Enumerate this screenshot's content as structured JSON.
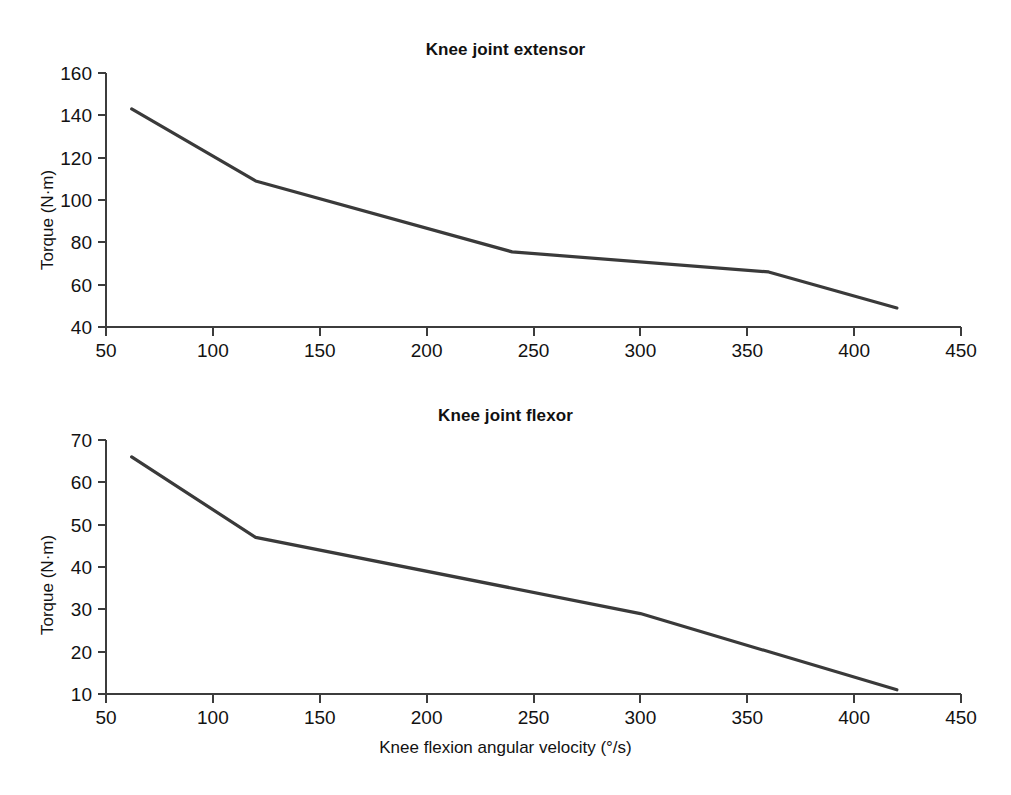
{
  "figure": {
    "background": "#ffffff",
    "line_color": "#3a3a3a",
    "axis_color": "#3c3c3c",
    "shared_xlabel": "Knee flexion angular velocity (°/s)"
  },
  "chart_data": [
    {
      "type": "line",
      "title": "Knee joint extensor",
      "xlabel": "Knee flexion angular velocity (°/s)",
      "ylabel": "Torque (N·m)",
      "xlim": [
        50,
        450
      ],
      "ylim": [
        40,
        160
      ],
      "xticks": [
        50,
        100,
        150,
        200,
        250,
        300,
        350,
        400,
        450
      ],
      "xtick_labels": [
        "50",
        "100",
        "150",
        "200",
        "250",
        "300",
        "350",
        "400",
        "450"
      ],
      "yticks": [
        40,
        60,
        80,
        100,
        120,
        140,
        160
      ],
      "ytick_labels": [
        "40",
        "60",
        "80",
        "100",
        "120",
        "140",
        "160"
      ],
      "grid": false,
      "legend": "none",
      "series": [
        {
          "name": "Knee joint extensor torque",
          "x": [
            62,
            120,
            240,
            360,
            420
          ],
          "values": [
            143,
            109,
            75.5,
            66,
            49
          ]
        }
      ]
    },
    {
      "type": "line",
      "title": "Knee joint flexor",
      "xlabel": "Knee flexion angular velocity (°/s)",
      "ylabel": "Torque (N·m)",
      "xlim": [
        50,
        450
      ],
      "ylim": [
        10,
        70
      ],
      "xticks": [
        50,
        100,
        150,
        200,
        250,
        300,
        350,
        400,
        450
      ],
      "xtick_labels": [
        "50",
        "100",
        "150",
        "200",
        "250",
        "300",
        "350",
        "400",
        "450"
      ],
      "yticks": [
        10,
        20,
        30,
        40,
        50,
        60,
        70
      ],
      "ytick_labels": [
        "10",
        "20",
        "30",
        "40",
        "50",
        "60",
        "70"
      ],
      "grid": false,
      "legend": "none",
      "series": [
        {
          "name": "Knee joint flexor torque",
          "x": [
            62,
            120,
            300,
            420
          ],
          "values": [
            66,
            47,
            29,
            11
          ]
        }
      ]
    }
  ]
}
